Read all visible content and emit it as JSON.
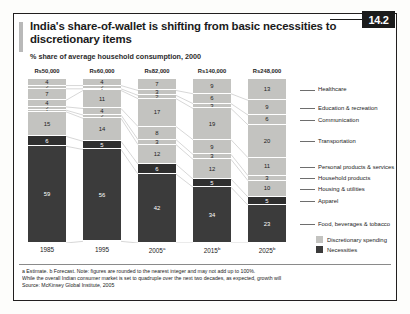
{
  "badge": "14.2",
  "title": "India's share-of-wallet is shifting from basic necessities to discretionary items",
  "subtitle": "% share of average household consumption, 2000",
  "legend": {
    "discretionary": "Discretionary spending",
    "necessities": "Necessities"
  },
  "notes": {
    "line1": "a Estimate.   b Forecast. Note: figures are rounded to the nearest integer and may not add up to 100%.",
    "line2": "While the overall Indian consumer market is set to quadruple over the next two decades, as expected, growth will",
    "line3": "Source: McKinsey Global Institute, 2005"
  },
  "colors": {
    "discretionary": "#c3c3c0",
    "necessities": "#3b3b3b",
    "badge_bg": "#1b1b1b",
    "text": "#1b1b1b"
  },
  "chart_data": {
    "type": "bar",
    "title": "India's share-of-wallet is shifting from basic necessities to discretionary items",
    "subtitle": "% share of average household consumption, 2000",
    "xlabel": "",
    "ylabel": "% share of average household consumption",
    "ylim": [
      0,
      100
    ],
    "grid": false,
    "legend_position": "bottom-right",
    "stacked": true,
    "categories": [
      "1985",
      "1995",
      "2005a",
      "2015b",
      "2025b"
    ],
    "category_labels": [
      "1985",
      "1995",
      "2005",
      "2015",
      "2025"
    ],
    "category_superscripts": [
      "",
      "",
      "a",
      "b",
      "b"
    ],
    "bar_totals_label": [
      "Rs50,000",
      "Rs60,000",
      "Rs82,000",
      "Rs140,000",
      "Rs248,000"
    ],
    "series": [
      {
        "name": "Healthcare",
        "type": "discretionary",
        "values": [
          4,
          4,
          7,
          9,
          13
        ]
      },
      {
        "name": "Education & recreation",
        "type": "discretionary",
        "values": [
          2,
          2,
          3,
          6,
          9
        ]
      },
      {
        "name": "Communication",
        "type": "discretionary",
        "values": [
          7,
          1,
          2,
          3,
          6
        ]
      },
      {
        "name": "Transportation",
        "type": "discretionary",
        "values": [
          4,
          11,
          17,
          19,
          20
        ]
      },
      {
        "name": "Personal products & services",
        "type": "discretionary",
        "values": [
          2,
          4,
          8,
          9,
          11
        ]
      },
      {
        "name": "Household products",
        "type": "discretionary",
        "values": [
          1,
          2,
          3,
          3,
          3
        ]
      },
      {
        "name": "Housing & utilities",
        "type": "discretionary",
        "values": [
          15,
          14,
          12,
          12,
          10
        ]
      },
      {
        "name": "Apparel",
        "type": "necessities",
        "values": [
          6,
          5,
          6,
          5,
          5
        ]
      },
      {
        "name": "Food, beverages & tobacco",
        "type": "necessities",
        "values": [
          59,
          56,
          42,
          34,
          23
        ]
      }
    ],
    "right_axis_labels": [
      "Healthcare",
      "Education & recreation",
      "Communication",
      "Transportation",
      "Personal products & services",
      "Household products",
      "Housing & utilities",
      "Apparel",
      "Food, beverages & tobacco"
    ]
  }
}
